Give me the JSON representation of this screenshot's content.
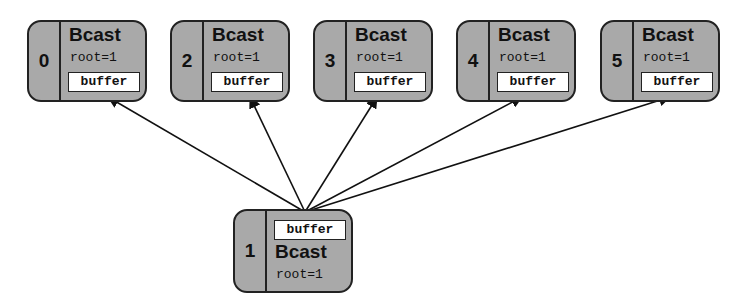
{
  "diagram": {
    "type": "MPI broadcast",
    "root": {
      "rank": "1",
      "op": "Bcast",
      "arg": "root=1",
      "buffer": "buffer"
    },
    "receivers": [
      {
        "rank": "0",
        "op": "Bcast",
        "arg": "root=1",
        "buffer": "buffer"
      },
      {
        "rank": "2",
        "op": "Bcast",
        "arg": "root=1",
        "buffer": "buffer"
      },
      {
        "rank": "3",
        "op": "Bcast",
        "arg": "root=1",
        "buffer": "buffer"
      },
      {
        "rank": "4",
        "op": "Bcast",
        "arg": "root=1",
        "buffer": "buffer"
      },
      {
        "rank": "5",
        "op": "Bcast",
        "arg": "root=1",
        "buffer": "buffer"
      }
    ],
    "edges": [
      {
        "from": "1",
        "to": "0"
      },
      {
        "from": "1",
        "to": "2"
      },
      {
        "from": "1",
        "to": "3"
      },
      {
        "from": "1",
        "to": "4"
      },
      {
        "from": "1",
        "to": "5"
      }
    ],
    "colors": {
      "box_fill": "#a9a9a9",
      "stroke": "#222222",
      "buffer_fill": "#ffffff"
    }
  }
}
